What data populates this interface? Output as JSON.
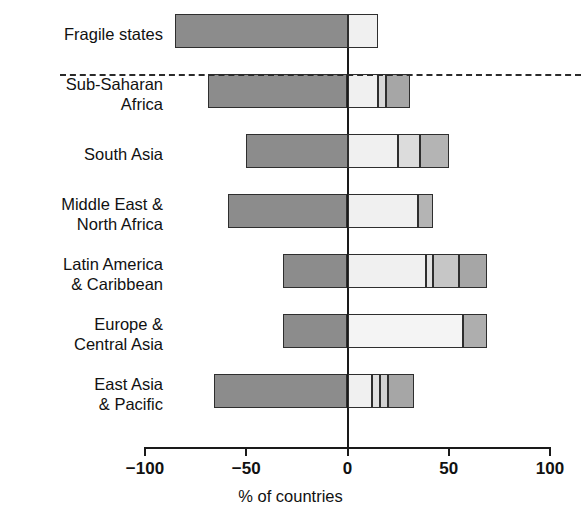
{
  "chart_data": {
    "type": "bar",
    "orientation": "horizontal",
    "subtype": "diverging-stacked-bar",
    "title": "",
    "xlabel": "% of countries",
    "ylabel": "",
    "xlim": [
      -100,
      100
    ],
    "xticks": [
      -100,
      -50,
      0,
      50,
      100
    ],
    "xticklabels": [
      "−100",
      "−50",
      "0",
      "50",
      "100"
    ],
    "grid": false,
    "legend": "none",
    "categories": [
      "Fragile states",
      "Sub-Saharan\nAfrica",
      "South Asia",
      "Middle East &\nNorth Africa",
      "Latin America\n& Caribbean",
      "Europe &\nCentral Asia",
      "East Asia\n& Pacific"
    ],
    "series": [
      {
        "name": "negative",
        "color": "#8c8c8c",
        "values": [
          -85,
          -69,
          -50,
          -59,
          -32,
          -32,
          -66
        ]
      },
      {
        "name": "positive-1",
        "color": "#f0f0f0",
        "values": [
          15,
          15,
          25,
          35,
          39,
          57,
          11
        ]
      },
      {
        "name": "positive-2",
        "color": "#e0e0e0",
        "values": [
          0,
          4,
          0,
          0,
          3,
          0,
          4
        ]
      },
      {
        "name": "positive-3",
        "color": "#c8c8c8",
        "values": [
          0,
          0,
          11,
          0,
          13,
          0,
          5
        ]
      },
      {
        "name": "positive-4",
        "color": "#a6a6a6",
        "values": [
          0,
          12,
          14,
          7,
          14,
          12,
          13
        ]
      }
    ],
    "rows": [
      {
        "label": "Fragile states",
        "separator_below": true,
        "segments": [
          {
            "from": -85,
            "to": 0,
            "color": "#8c8c8c"
          },
          {
            "from": 0,
            "to": 15,
            "color": "#f0f0f0"
          }
        ]
      },
      {
        "label": "Sub-Saharan\nAfrica",
        "separator_below": false,
        "segments": [
          {
            "from": -69,
            "to": 0,
            "color": "#8c8c8c"
          },
          {
            "from": 0,
            "to": 15,
            "color": "#f0f0f0"
          },
          {
            "from": 15,
            "to": 19,
            "color": "#d8d8d8"
          },
          {
            "from": 19,
            "to": 31,
            "color": "#a6a6a6"
          }
        ]
      },
      {
        "label": "South Asia",
        "separator_below": false,
        "segments": [
          {
            "from": -50,
            "to": 0,
            "color": "#8c8c8c"
          },
          {
            "from": 0,
            "to": 25,
            "color": "#f0f0f0"
          },
          {
            "from": 25,
            "to": 36,
            "color": "#dcdcdc"
          },
          {
            "from": 36,
            "to": 50,
            "color": "#b4b4b4"
          }
        ]
      },
      {
        "label": "Middle East &\nNorth Africa",
        "separator_below": false,
        "segments": [
          {
            "from": -59,
            "to": 0,
            "color": "#8c8c8c"
          },
          {
            "from": 0,
            "to": 35,
            "color": "#f0f0f0"
          },
          {
            "from": 35,
            "to": 42,
            "color": "#b4b4b4"
          }
        ]
      },
      {
        "label": "Latin America\n& Caribbean",
        "separator_below": false,
        "segments": [
          {
            "from": -32,
            "to": 0,
            "color": "#8c8c8c"
          },
          {
            "from": 0,
            "to": 39,
            "color": "#f0f0f0"
          },
          {
            "from": 39,
            "to": 42,
            "color": "#e2e2e2"
          },
          {
            "from": 42,
            "to": 55,
            "color": "#c6c6c6"
          },
          {
            "from": 55,
            "to": 69,
            "color": "#a6a6a6"
          }
        ]
      },
      {
        "label": "Europe &\nCentral Asia",
        "separator_below": false,
        "segments": [
          {
            "from": -32,
            "to": 0,
            "color": "#8c8c8c"
          },
          {
            "from": 0,
            "to": 57,
            "color": "#f4f4f4"
          },
          {
            "from": 57,
            "to": 69,
            "color": "#aeaeae"
          }
        ]
      },
      {
        "label": "East Asia\n& Pacific",
        "separator_below": false,
        "segments": [
          {
            "from": -66,
            "to": 0,
            "color": "#8c8c8c"
          },
          {
            "from": 0,
            "to": 12,
            "color": "#f0f0f0"
          },
          {
            "from": 12,
            "to": 16,
            "color": "#e0e0e0"
          },
          {
            "from": 16,
            "to": 20,
            "color": "#d2d2d2"
          },
          {
            "from": 20,
            "to": 33,
            "color": "#a6a6a6"
          }
        ]
      }
    ]
  },
  "axis": {
    "x_title": "% of countries",
    "ticks": [
      {
        "value": -100,
        "label": "−100"
      },
      {
        "value": -50,
        "label": "−50"
      },
      {
        "value": 0,
        "label": "0"
      },
      {
        "value": 50,
        "label": "50"
      },
      {
        "value": 100,
        "label": "100"
      }
    ]
  },
  "colors": {
    "bar_negative": "#8c8c8c",
    "bar_light": "#f0f0f0",
    "bar_mid_light": "#dcdcdc",
    "bar_mid": "#c6c6c6",
    "bar_dark": "#a6a6a6",
    "outline": "#2e2e2e",
    "axis": "#1a1a1a",
    "background": "#ffffff"
  }
}
